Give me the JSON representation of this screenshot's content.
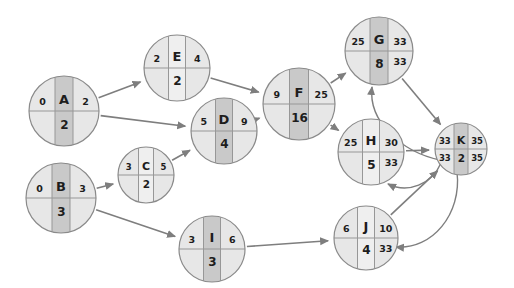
{
  "diagram_title": "",
  "colors": {
    "background": "#ffffff",
    "node_fill": "#e7e7e7",
    "band_highlight": "#c9c9c9",
    "band_normal": "#efefef",
    "outline": "#8a8a8a",
    "divider": "#979797",
    "arrow": "#7e7e7e",
    "text": "#1d1d1d"
  },
  "nodes": [
    {
      "id": "A",
      "letter": "A",
      "duration": "2",
      "early_start": "0",
      "late_start": "",
      "early_finish": "2",
      "late_finish": "",
      "highlighted": true
    },
    {
      "id": "E",
      "letter": "E",
      "duration": "2",
      "early_start": "2",
      "late_start": "",
      "early_finish": "4",
      "late_finish": "",
      "highlighted": false
    },
    {
      "id": "B",
      "letter": "B",
      "duration": "3",
      "early_start": "0",
      "late_start": "",
      "early_finish": "3",
      "late_finish": "",
      "highlighted": true
    },
    {
      "id": "C",
      "letter": "C",
      "duration": "2",
      "early_start": "3",
      "late_start": "",
      "early_finish": "5",
      "late_finish": "",
      "highlighted": false
    },
    {
      "id": "D",
      "letter": "D",
      "duration": "4",
      "early_start": "5",
      "late_start": "",
      "early_finish": "9",
      "late_finish": "",
      "highlighted": true
    },
    {
      "id": "I",
      "letter": "I",
      "duration": "3",
      "early_start": "3",
      "late_start": "",
      "early_finish": "6",
      "late_finish": "",
      "highlighted": true
    },
    {
      "id": "F",
      "letter": "F",
      "duration": "16",
      "early_start": "9",
      "late_start": "",
      "early_finish": "25",
      "late_finish": "",
      "highlighted": true
    },
    {
      "id": "G",
      "letter": "G",
      "duration": "8",
      "early_start": "25",
      "late_start": "",
      "early_finish": "33",
      "late_finish": "33",
      "highlighted": true
    },
    {
      "id": "H",
      "letter": "H",
      "duration": "5",
      "early_start": "25",
      "late_start": "",
      "early_finish": "30",
      "late_finish": "33",
      "highlighted": false
    },
    {
      "id": "J",
      "letter": "J",
      "duration": "4",
      "early_start": "6",
      "late_start": "",
      "early_finish": "10",
      "late_finish": "33",
      "highlighted": false
    },
    {
      "id": "K",
      "letter": "K",
      "duration": "2",
      "early_start": "33",
      "late_start": "33",
      "early_finish": "35",
      "late_finish": "35",
      "highlighted": true
    }
  ],
  "edges": [
    {
      "from": "A",
      "to": "E",
      "kind": "forward"
    },
    {
      "from": "A",
      "to": "D",
      "kind": "forward"
    },
    {
      "from": "B",
      "to": "C",
      "kind": "forward"
    },
    {
      "from": "B",
      "to": "I",
      "kind": "forward"
    },
    {
      "from": "C",
      "to": "D",
      "kind": "forward"
    },
    {
      "from": "E",
      "to": "F",
      "kind": "forward"
    },
    {
      "from": "D",
      "to": "F",
      "kind": "forward"
    },
    {
      "from": "F",
      "to": "G",
      "kind": "forward"
    },
    {
      "from": "F",
      "to": "H",
      "kind": "forward"
    },
    {
      "from": "G",
      "to": "K",
      "kind": "forward"
    },
    {
      "from": "H",
      "to": "K",
      "kind": "forward"
    },
    {
      "from": "I",
      "to": "J",
      "kind": "forward"
    },
    {
      "from": "J",
      "to": "K",
      "kind": "forward"
    },
    {
      "from": "K",
      "to": "G",
      "kind": "backward"
    },
    {
      "from": "K",
      "to": "H",
      "kind": "backward"
    },
    {
      "from": "K",
      "to": "J",
      "kind": "backward"
    }
  ]
}
